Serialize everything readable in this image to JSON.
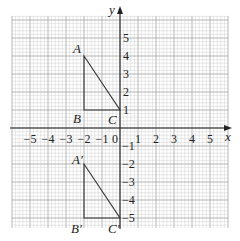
{
  "diagram": {
    "type": "coordinate-grid",
    "axes": {
      "x_label": "x",
      "y_label": "y",
      "x_ticks": [
        "-5",
        "-4",
        "-3",
        "-2",
        "-1",
        "1",
        "2",
        "3",
        "4",
        "5"
      ],
      "y_ticks": [
        "5",
        "4",
        "3",
        "2",
        "1",
        "-1",
        "-2",
        "-3",
        "-4",
        "-5"
      ],
      "origin_label": "0",
      "range": {
        "xmin": -6,
        "xmax": 6,
        "ymin": -5.5,
        "ymax": 6
      }
    },
    "grid": {
      "minor_per_unit": 5,
      "color_minor": "#c8c8c8",
      "color_major": "#9a9a9a"
    },
    "shapes": [
      {
        "name": "triangle-ABC",
        "points": [
          {
            "label": "A",
            "x": -2,
            "y": 4
          },
          {
            "label": "B",
            "x": -2,
            "y": 1
          },
          {
            "label": "C",
            "x": 0,
            "y": 1
          }
        ]
      },
      {
        "name": "triangle-A'B'C'",
        "points": [
          {
            "label": "A′",
            "x": -2,
            "y": -2
          },
          {
            "label": "B′",
            "x": -2,
            "y": -5
          },
          {
            "label": "C′",
            "x": 0,
            "y": -5
          }
        ]
      }
    ],
    "colors": {
      "line": "#333333",
      "axis": "#222222",
      "text": "#222222"
    }
  },
  "labels": {
    "A": "A",
    "B": "B",
    "C": "C",
    "A2": "A′",
    "B2": "B′",
    "C2": "C′",
    "x": "x",
    "y": "y",
    "origin": "0",
    "xt": {
      "m5": "−5",
      "m4": "−4",
      "m3": "−3",
      "m2": "−2",
      "m1": "−1",
      "p1": "1",
      "p2": "2",
      "p3": "3",
      "p4": "4",
      "p5": "5"
    },
    "yt": {
      "p5": "5",
      "p4": "4",
      "p3": "3",
      "p2": "2",
      "p1": "1",
      "m1": "−1",
      "m2": "−2",
      "m3": "−3",
      "m4": "−4",
      "m5": "−5"
    }
  }
}
